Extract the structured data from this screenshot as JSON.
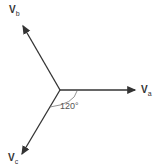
{
  "diagram": {
    "phasors": [
      {
        "name": "Va",
        "main": "V",
        "sub": "a"
      },
      {
        "name": "Vb",
        "main": "V",
        "sub": "b"
      },
      {
        "name": "Vc",
        "main": "V",
        "sub": "c"
      }
    ],
    "angle_label": "120°"
  }
}
